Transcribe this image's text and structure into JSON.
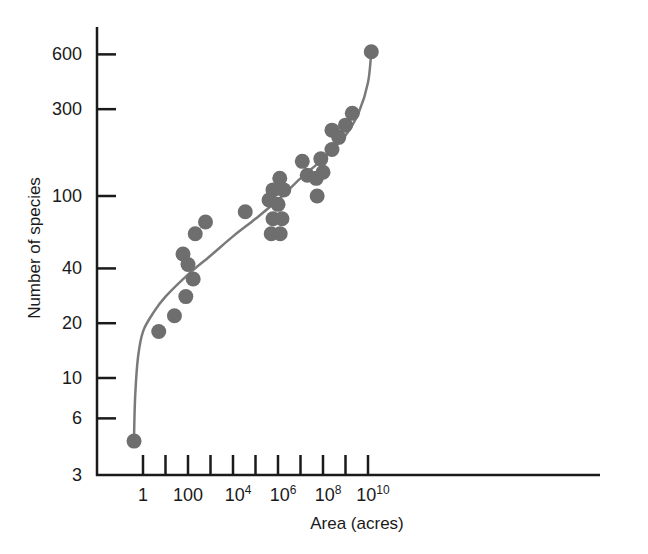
{
  "chart_data": {
    "type": "scatter",
    "title": "",
    "xlabel": "Area (acres)",
    "ylabel": "Number of  species",
    "xscale": "log",
    "yscale": "log",
    "xlim": [
      0.3,
      30000000000.0
    ],
    "ylim": [
      3,
      800
    ],
    "grid": false,
    "legend": null,
    "x_ticks": [
      {
        "value": 1,
        "label": "1",
        "labeled": true
      },
      {
        "value": 10,
        "label": "",
        "labeled": false
      },
      {
        "value": 100,
        "label": "100",
        "labeled": true
      },
      {
        "value": 1000,
        "label": "",
        "labeled": false
      },
      {
        "value": 10000,
        "label": "10^4",
        "base": "10",
        "exp": "4",
        "labeled": true
      },
      {
        "value": 100000,
        "label": "",
        "labeled": false
      },
      {
        "value": 1000000,
        "label": "10^6",
        "base": "10",
        "exp": "6",
        "labeled": true
      },
      {
        "value": 10000000,
        "label": "",
        "labeled": false
      },
      {
        "value": 100000000,
        "label": "10^8",
        "base": "10",
        "exp": "8",
        "labeled": true
      },
      {
        "value": 1000000000,
        "label": "",
        "labeled": false
      },
      {
        "value": 10000000000,
        "label": "10^10",
        "base": "10",
        "exp": "10",
        "labeled": true
      }
    ],
    "y_ticks": [
      3,
      6,
      10,
      20,
      40,
      100,
      300,
      600
    ],
    "y_tick_labels": [
      "3",
      "6",
      "10",
      "20",
      "40",
      "100",
      "300",
      "600"
    ],
    "series": [
      {
        "name": "observations",
        "kind": "scatter",
        "color": "#6e6e6e",
        "points": [
          {
            "x": 0.4,
            "y": 4.5
          },
          {
            "x": 5,
            "y": 18
          },
          {
            "x": 25,
            "y": 22
          },
          {
            "x": 60,
            "y": 48
          },
          {
            "x": 80,
            "y": 28
          },
          {
            "x": 100,
            "y": 42
          },
          {
            "x": 170,
            "y": 35
          },
          {
            "x": 210,
            "y": 62
          },
          {
            "x": 600,
            "y": 72
          },
          {
            "x": 35000,
            "y": 82
          },
          {
            "x": 400000,
            "y": 95
          },
          {
            "x": 600000,
            "y": 108
          },
          {
            "x": 600000,
            "y": 75
          },
          {
            "x": 500000,
            "y": 62
          },
          {
            "x": 1000000,
            "y": 90
          },
          {
            "x": 1200000,
            "y": 125
          },
          {
            "x": 1250000,
            "y": 62
          },
          {
            "x": 1500000,
            "y": 75
          },
          {
            "x": 1800000,
            "y": 108
          },
          {
            "x": 12000000,
            "y": 155
          },
          {
            "x": 20000000,
            "y": 130
          },
          {
            "x": 50000000,
            "y": 125
          },
          {
            "x": 55000000,
            "y": 100
          },
          {
            "x": 80000000,
            "y": 160
          },
          {
            "x": 100000000,
            "y": 135
          },
          {
            "x": 250000000,
            "y": 180
          },
          {
            "x": 250000000,
            "y": 230
          },
          {
            "x": 500000000,
            "y": 210
          },
          {
            "x": 1000000000,
            "y": 245
          },
          {
            "x": 2000000000,
            "y": 285
          },
          {
            "x": 14000000000,
            "y": 620
          }
        ]
      },
      {
        "name": "fitted curve",
        "kind": "line",
        "color": "#7a7a7a",
        "points": [
          {
            "x": 0.4,
            "y": 4.8
          },
          {
            "x": 0.45,
            "y": 8
          },
          {
            "x": 0.6,
            "y": 13
          },
          {
            "x": 1,
            "y": 18
          },
          {
            "x": 3,
            "y": 23
          },
          {
            "x": 10,
            "y": 28
          },
          {
            "x": 100,
            "y": 37
          },
          {
            "x": 1000,
            "y": 47
          },
          {
            "x": 10000,
            "y": 60
          },
          {
            "x": 100000,
            "y": 75
          },
          {
            "x": 1000000,
            "y": 95
          },
          {
            "x": 10000000,
            "y": 125
          },
          {
            "x": 100000000,
            "y": 160
          },
          {
            "x": 1000000000,
            "y": 215
          },
          {
            "x": 4000000000,
            "y": 290
          },
          {
            "x": 10000000000,
            "y": 420
          },
          {
            "x": 14000000000,
            "y": 620
          }
        ]
      }
    ]
  },
  "style": {
    "axis_color": "#1a1a1a",
    "point_color": "#6e6e6e",
    "curve_color": "#7a7a7a",
    "background": "#ffffff"
  }
}
